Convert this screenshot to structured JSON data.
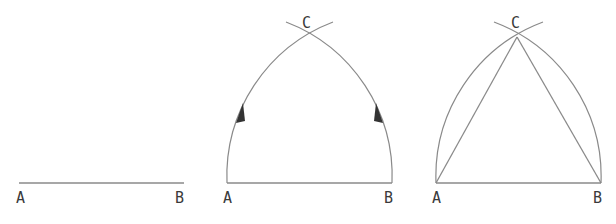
{
  "figure": {
    "panels": [
      {
        "id": "step-1",
        "description": "Segment AB",
        "labels": {
          "a": "A",
          "b": "B"
        }
      },
      {
        "id": "step-2",
        "description": "Arcs from A and B with radius AB intersecting at C",
        "labels": {
          "a": "A",
          "b": "B",
          "c": "C"
        }
      },
      {
        "id": "step-3",
        "description": "Equilateral triangle ABC",
        "labels": {
          "a": "A",
          "b": "B",
          "c": "C"
        }
      }
    ],
    "colors": {
      "stroke": "#8a8a8a",
      "label": "#3a3a3a",
      "arrow": "#333333",
      "background": "#ffffff"
    }
  }
}
